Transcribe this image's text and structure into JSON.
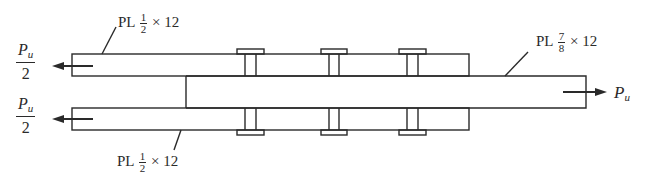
{
  "diagram": {
    "type": "bolted double-lap splice (plate connection)",
    "labels": {
      "top_plate": {
        "prefix": "PL",
        "frac_num": "1",
        "frac_den": "2",
        "suffix": "× 12"
      },
      "bottom_plate": {
        "prefix": "PL",
        "frac_num": "1",
        "frac_den": "2",
        "suffix": "× 12"
      },
      "middle_plate": {
        "prefix": "PL",
        "frac_num": "7",
        "frac_den": "8",
        "suffix": "× 12"
      }
    },
    "forces": {
      "left_top": {
        "symbol": "P",
        "subscript": "u",
        "denominator": "2"
      },
      "left_bottom": {
        "symbol": "P",
        "subscript": "u",
        "denominator": "2"
      },
      "right": {
        "symbol": "P",
        "subscript": "u"
      }
    },
    "bolt_count": 3,
    "colors": {
      "line": "#2a2a2a",
      "background": "#ffffff"
    }
  }
}
